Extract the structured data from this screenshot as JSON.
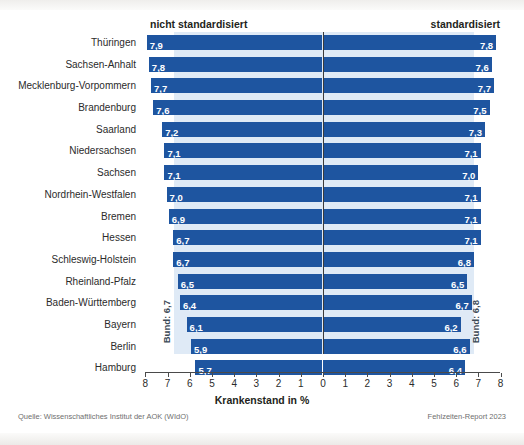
{
  "chart_data": {
    "type": "bar",
    "orientation": "horizontal-diverging",
    "title": "",
    "xlabel": "Krankenstand in %",
    "ylabel": "",
    "grid": false,
    "legend_position": "top",
    "axis": {
      "left_ticks": [
        8,
        7,
        6,
        5,
        4,
        3,
        2,
        1,
        0
      ],
      "right_ticks": [
        1,
        2,
        3,
        4,
        5,
        6,
        7,
        8
      ],
      "all_tick_labels": [
        "8",
        "7",
        "6",
        "5",
        "4",
        "3",
        "2",
        "1",
        "0",
        "1",
        "2",
        "3",
        "4",
        "5",
        "6",
        "7",
        "8"
      ],
      "max": 8,
      "min": 0
    },
    "series": [
      {
        "name": "nicht standardisiert",
        "side": "left",
        "values": [
          7.9,
          7.8,
          7.7,
          7.6,
          7.2,
          7.1,
          7.1,
          7.0,
          6.9,
          6.7,
          6.7,
          6.5,
          6.4,
          6.1,
          5.9,
          5.7
        ],
        "labels": [
          "7,9",
          "7,8",
          "7,7",
          "7,6",
          "7,2",
          "7,1",
          "7,1",
          "7,0",
          "6,9",
          "6,7",
          "6,7",
          "6,5",
          "6,4",
          "6,1",
          "5,9",
          "5,7"
        ]
      },
      {
        "name": "standardisiert",
        "side": "right",
        "values": [
          7.8,
          7.6,
          7.7,
          7.5,
          7.3,
          7.1,
          7.0,
          7.1,
          7.1,
          7.1,
          6.8,
          6.5,
          6.7,
          6.2,
          6.6,
          6.4
        ],
        "labels": [
          "7,8",
          "7,6",
          "7,7",
          "7,5",
          "7,3",
          "7,1",
          "7,0",
          "7,1",
          "7,1",
          "7,1",
          "6,8",
          "6,5",
          "6,7",
          "6,2",
          "6,6",
          "6,4"
        ]
      }
    ],
    "categories": [
      "Thüringen",
      "Sachsen-Anhalt",
      "Mecklenburg-Vorpommern",
      "Brandenburg",
      "Saarland",
      "Niedersachsen",
      "Sachsen",
      "Nordrhein-Westfalen",
      "Bremen",
      "Hessen",
      "Schleswig-Holstein",
      "Rheinland-Pfalz",
      "Baden-Württemberg",
      "Bayern",
      "Berlin",
      "Hamburg"
    ],
    "reference_lines": [
      {
        "name": "Bund: 6,7",
        "side": "left",
        "value": 6.7
      },
      {
        "name": "Bund: 6,8",
        "side": "right",
        "value": 6.8
      }
    ],
    "colors": {
      "bar": "#1e55a0",
      "reference_band": "#dfeaf6",
      "zero_axis": "#3a3a3a",
      "value_label": "#ffffff"
    }
  },
  "headers": {
    "left": "nicht standardisiert",
    "right": "standardisiert"
  },
  "bund": {
    "left": "Bund: 6,7",
    "right": "Bund: 6,8"
  },
  "footer": {
    "source": "Quelle: Wissenschaftliches Institut der AOK (WIdO)",
    "report": "Fehlzeiten-Report 2023"
  }
}
